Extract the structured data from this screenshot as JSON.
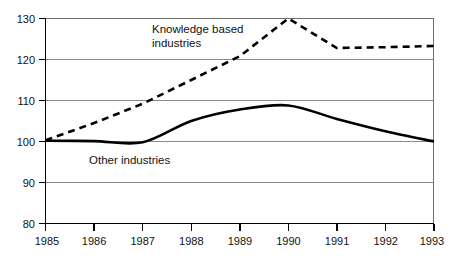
{
  "chart_data": {
    "type": "line",
    "title": "",
    "subtitle": "",
    "xlabel": "",
    "ylabel": "",
    "grid": true,
    "legend_position": "inline-annotation",
    "x": [
      1985,
      1986,
      1987,
      1988,
      1989,
      1990,
      1991,
      1992,
      1993
    ],
    "xlim": [
      1985,
      1993
    ],
    "ylim": [
      80,
      130
    ],
    "xticks": [
      "1985",
      "1986",
      "1987",
      "1988",
      "1989",
      "1990",
      "1991",
      "1992",
      "1993"
    ],
    "yticks": [
      "80",
      "90",
      "100",
      "110",
      "120",
      "130"
    ],
    "series": [
      {
        "name": "Knowledge based industries",
        "style": "dashed",
        "color": "#000000",
        "values": [
          100.3,
          104.5,
          109.2,
          115.0,
          120.8,
          130.0,
          122.8,
          123.0,
          123.3
        ]
      },
      {
        "name": "Other industries",
        "style": "solid",
        "color": "#000000",
        "values": [
          100.2,
          100.1,
          99.8,
          105.0,
          107.8,
          108.8,
          105.5,
          102.5,
          100.0
        ]
      }
    ],
    "annotations": [
      {
        "text_line1": "Knowledge based",
        "text_line2": "industries",
        "x": 1988.0,
        "y": 128.2
      },
      {
        "text": "Other industries",
        "x": 1986.3,
        "y": 97.4
      }
    ]
  },
  "labels": {
    "knowledge_line1": "Knowledge based",
    "knowledge_line2": "industries",
    "other": "Other industries",
    "y_80": "80",
    "y_90": "90",
    "y_100": "100",
    "y_110": "110",
    "y_120": "120",
    "y_130": "130",
    "x_1985": "1985",
    "x_1986": "1986",
    "x_1987": "1987",
    "x_1988": "1988",
    "x_1989": "1989",
    "x_1990": "1990",
    "x_1991": "1991",
    "x_1992": "1992",
    "x_1993": "1993"
  },
  "colors": {
    "line": "#000000",
    "grid": "#8a8a8a",
    "frame": "#6f6f6f",
    "background": "#ffffff"
  }
}
